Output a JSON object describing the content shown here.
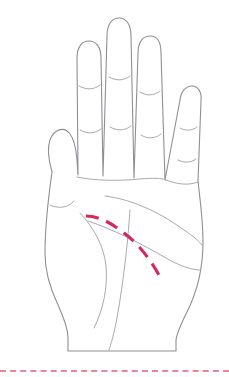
{
  "figure": {
    "width": 229,
    "height": 377,
    "background_color": "#ffffff",
    "outline_color": "#8f8f96",
    "crease_color": "#a9a9b0",
    "highlight_color": "#d4295a",
    "footer_rule_color": "#e8849c",
    "footer_rule_y": 370
  },
  "hand": {
    "orientation": "palm-facing-viewer",
    "side": "left",
    "outline_path": "M 52 172 C 48 158, 47 148, 50 140 C 54 129, 64 126, 70 134 C 74 139, 76 148, 77 160 L 78 175 L 77 58 C 77 47, 82 41, 89 41 C 96 41, 101 47, 101 58 L 103 176 L 107 36 C 107 24, 112 18, 119 18 C 126 18, 131 24, 131 36 L 134 178 L 138 53 C 138 42, 143 36, 150 36 C 157 36, 161 42, 161 53 L 165 180 L 180 100 C 181 91, 186 86, 192 86 C 198 86, 202 92, 201 101 L 198 181 C 200 200, 203 220, 203 242 C 203 268, 197 292, 187 312 C 181 324, 177 332, 176 340 L 176 351 L 68 351 L 68 338 C 68 328, 64 318, 58 305 C 50 288, 45 272, 45 254 C 45 232, 48 200, 52 172 Z",
    "fingers": [
      {
        "name": "thumb",
        "label": "thumb"
      },
      {
        "name": "index-finger",
        "label": "index finger"
      },
      {
        "name": "middle-finger",
        "label": "middle finger"
      },
      {
        "name": "ring-finger",
        "label": "ring finger"
      },
      {
        "name": "pinky-finger",
        "label": "little finger"
      }
    ],
    "knuckle_creases": [
      {
        "name": "thumb-crease",
        "path": "M 50 205 C 58 209, 68 208, 74 201"
      },
      {
        "name": "index-crease-upper",
        "path": "M 79 86 C 86 90, 94 90, 100 85"
      },
      {
        "name": "index-crease-lower",
        "path": "M 80 130 C 87 134, 95 134, 101 129"
      },
      {
        "name": "middle-crease-upper",
        "path": "M 109 77 C 116 81, 124 81, 130 76"
      },
      {
        "name": "middle-crease-lower",
        "path": "M 110 127 C 117 131, 125 131, 131 126"
      },
      {
        "name": "ring-crease-upper",
        "path": "M 140 92 C 146 96, 154 96, 160 91"
      },
      {
        "name": "ring-crease-lower",
        "path": "M 141 135 C 147 139, 155 139, 161 134"
      },
      {
        "name": "pinky-crease-upper",
        "path": "M 180 128 C 185 131, 192 131, 197 127"
      },
      {
        "name": "pinky-crease-lower",
        "path": "M 178 160 C 184 163, 191 163, 196 159"
      }
    ],
    "palm_lines": [
      {
        "name": "knuckle-base-line",
        "path": "M 77 177 C 95 181, 120 181, 140 179 C 152 178, 162 178, 166 180"
      },
      {
        "name": "pinky-base-line",
        "path": "M 166 180 C 176 184, 188 186, 198 182"
      },
      {
        "name": "heart-line",
        "path": "M 105 196 C 130 199, 158 211, 184 230 C 193 236, 199 241, 202 245"
      },
      {
        "name": "head-line",
        "path": "M 88 221 C 112 229, 140 243, 166 258 C 180 266, 192 270, 200 270"
      },
      {
        "name": "life-line",
        "path": "M 80 213 C 94 228, 104 246, 106 266 C 108 288, 103 310, 94 328"
      },
      {
        "name": "fate-line",
        "path": "M 130 210 C 128 240, 124 278, 117 318 C 114 334, 111 344, 109 350"
      }
    ],
    "highlight": {
      "name": "highlighted-palm-line",
      "label": "life line highlight",
      "color": "#d4295a",
      "dash_pattern": "13 8",
      "path": "M 86 216 C 98 216, 110 222, 124 233 C 140 245, 152 262, 160 277"
    }
  }
}
